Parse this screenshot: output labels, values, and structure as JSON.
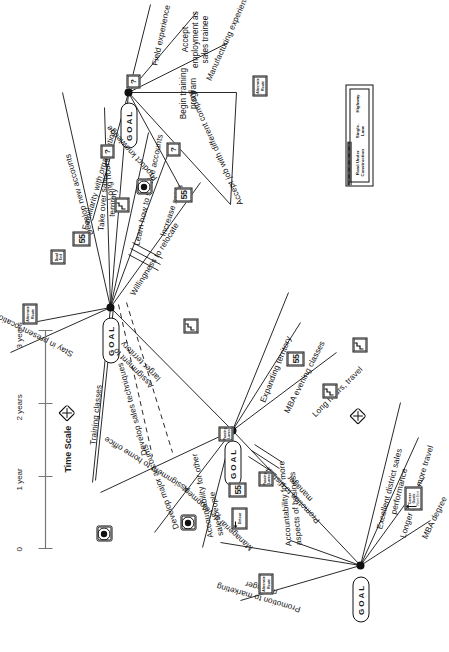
{
  "diagram": {
    "goal_label": "GOAL"
  },
  "nodes": [
    {
      "id": "n1",
      "goal": "GOAL"
    },
    {
      "id": "n2",
      "goal": "GOAL"
    },
    {
      "id": "n3",
      "goal": "GOAL"
    },
    {
      "id": "n4",
      "goal": "GOAL"
    }
  ],
  "paths": [
    {
      "label": "Promotion to marketing manager"
    },
    {
      "label": "Managerial development"
    },
    {
      "label": "Accountability for more aspects of business"
    },
    {
      "label": "Promotion to district manager"
    },
    {
      "label": "Assignment to home office"
    },
    {
      "label": "Excellent district sales performance"
    },
    {
      "label": "Longer hours, more travel"
    },
    {
      "label": "MBA degree"
    },
    {
      "label": "Expanding territory"
    },
    {
      "label": "MBA evening classes"
    },
    {
      "label": "Long hours, travel"
    },
    {
      "label": "Assignment to larger territory"
    },
    {
      "label": "Develop major accounts"
    },
    {
      "label": "Accountability for other salespeople"
    },
    {
      "label": "Stay in present location"
    },
    {
      "label": "Training classes"
    },
    {
      "label": "Develop sales techniques"
    },
    {
      "label": "Willingness to relocate"
    },
    {
      "label": "Develop new accounts"
    },
    {
      "label": "Long hours"
    },
    {
      "label": "Learn how to service accounts"
    },
    {
      "label": "Increase sales"
    },
    {
      "label": "Take over sales territory"
    },
    {
      "label": "Familiarity with organization"
    },
    {
      "label": "Product knowledge"
    },
    {
      "label": "Accept job with different company"
    },
    {
      "label": "Begin training program"
    },
    {
      "label": "Accept employment as sales trainee"
    },
    {
      "label": "Manufacturing experience"
    },
    {
      "label": "Field experience"
    }
  ],
  "signs": [
    {
      "type": "speed-limit",
      "text": "55"
    },
    {
      "type": "career-goals",
      "line1": "Career",
      "line2": "Goals",
      "line3": "Next Exit"
    },
    {
      "type": "detour",
      "text": "Detour"
    },
    {
      "type": "alternate-route",
      "line1": "Alternate",
      "line2": "Route"
    },
    {
      "type": "passing-lanes",
      "line1": "Passing",
      "line2": "Lanes"
    },
    {
      "type": "dead-end",
      "line1": "Dead",
      "line2": "End"
    },
    {
      "type": "railroad-crossing",
      "text": ""
    },
    {
      "type": "crossroad",
      "text": ""
    },
    {
      "type": "winding-road",
      "text": ""
    },
    {
      "type": "question",
      "text": "?"
    }
  ],
  "legend": {
    "title": "Legend",
    "items": [
      {
        "line1": "Road Under",
        "line2": "Construction",
        "style": "dashed"
      },
      {
        "line1": "Single-",
        "line2": "Lane",
        "style": "single"
      },
      {
        "line1": "Highway",
        "line2": "",
        "style": "double"
      }
    ]
  },
  "time_scale": {
    "title": "Time Scale",
    "ticks": [
      "0",
      "1 year",
      "2 years",
      "3 years"
    ]
  },
  "colors": {
    "ink": "#111111",
    "paper": "#ffffff"
  }
}
